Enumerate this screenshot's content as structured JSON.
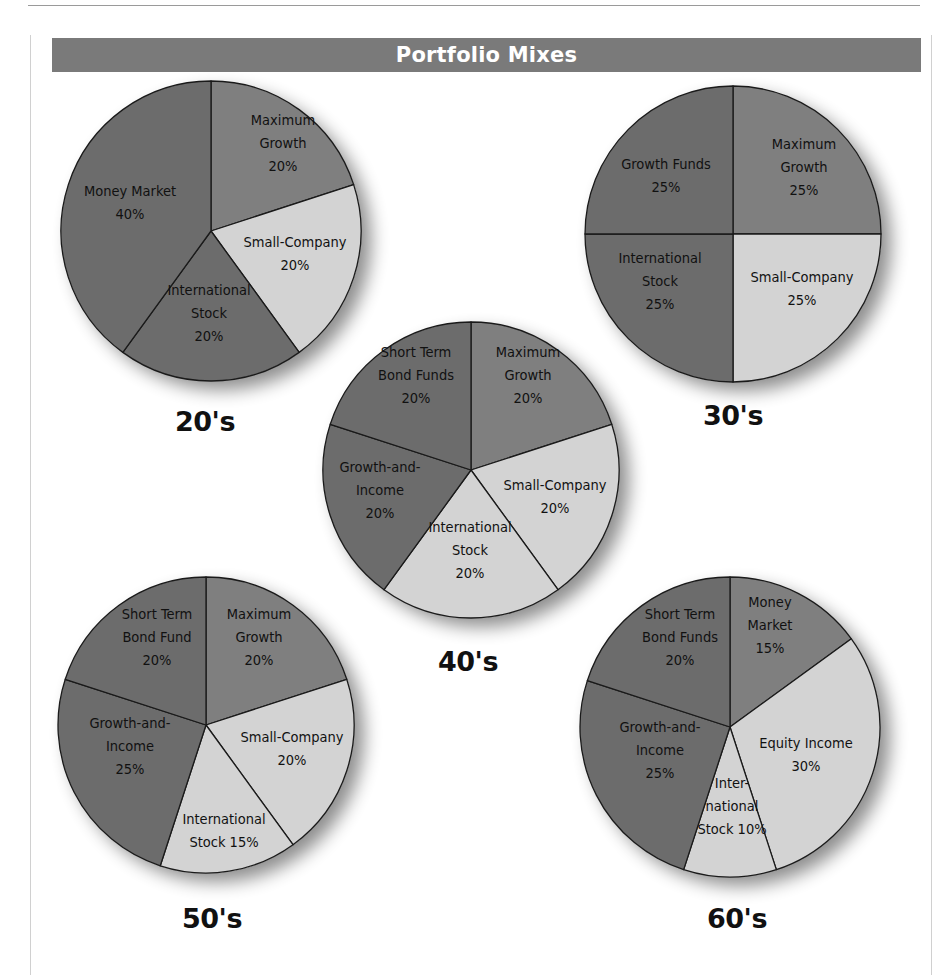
{
  "header": {
    "title": "Portfolio Mixes"
  },
  "colors": {
    "dark": "#6c6c6c",
    "medium": "#7f7f7f",
    "light": "#d3d3d3",
    "header_bg": "#7a7a7a",
    "outline": "#1a1a1a"
  },
  "chart_data": [
    {
      "type": "pie",
      "title": "20's",
      "center": [
        211,
        231
      ],
      "radius": 150,
      "label_pos": [
        205,
        428
      ],
      "slices": [
        {
          "label": [
            "Maximum",
            "Growth",
            "20%"
          ],
          "name": "Maximum Growth",
          "value": 20,
          "shade": "medium",
          "lx": 283,
          "ly": 143
        },
        {
          "label": [
            "Small-Company",
            "20%"
          ],
          "name": "Small-Company",
          "value": 20,
          "shade": "light",
          "lx": 295,
          "ly": 253
        },
        {
          "label": [
            "International",
            "Stock",
            "20%"
          ],
          "name": "International Stock",
          "value": 20,
          "shade": "dark",
          "lx": 209,
          "ly": 313
        },
        {
          "label": [
            "Money Market",
            "40%"
          ],
          "name": "Money Market",
          "value": 40,
          "shade": "dark",
          "lx": 130,
          "ly": 202
        }
      ]
    },
    {
      "type": "pie",
      "title": "30's",
      "center": [
        733,
        234
      ],
      "radius": 148,
      "label_pos": [
        733,
        422
      ],
      "slices": [
        {
          "label": [
            "Maximum",
            "Growth",
            "25%"
          ],
          "name": "Maximum Growth",
          "value": 25,
          "shade": "medium",
          "lx": 804,
          "ly": 167
        },
        {
          "label": [
            "Small-Company",
            "25%"
          ],
          "name": "Small-Company",
          "value": 25,
          "shade": "light",
          "lx": 802,
          "ly": 288
        },
        {
          "label": [
            "International",
            "Stock",
            "25%"
          ],
          "name": "International Stock",
          "value": 25,
          "shade": "dark",
          "lx": 660,
          "ly": 281
        },
        {
          "label": [
            "Growth Funds",
            "25%"
          ],
          "name": "Growth Funds",
          "value": 25,
          "shade": "dark",
          "lx": 666,
          "ly": 175
        }
      ]
    },
    {
      "type": "pie",
      "title": "40's",
      "center": [
        471,
        470
      ],
      "radius": 148,
      "label_pos": [
        468,
        668
      ],
      "slices": [
        {
          "label": [
            "Maximum",
            "Growth",
            "20%"
          ],
          "name": "Maximum Growth",
          "value": 20,
          "shade": "medium",
          "lx": 528,
          "ly": 375
        },
        {
          "label": [
            "Small-Company",
            "20%"
          ],
          "name": "Small-Company",
          "value": 20,
          "shade": "light",
          "lx": 555,
          "ly": 496
        },
        {
          "label": [
            "International",
            "Stock",
            "20%"
          ],
          "name": "International Stock",
          "value": 20,
          "shade": "light",
          "lx": 470,
          "ly": 550
        },
        {
          "label": [
            "Growth-and-",
            "Income",
            "20%"
          ],
          "name": "Growth-and-Income",
          "value": 20,
          "shade": "dark",
          "lx": 380,
          "ly": 490
        },
        {
          "label": [
            "Short Term",
            "Bond Funds",
            "20%"
          ],
          "name": "Short Term Bond Funds",
          "value": 20,
          "shade": "dark",
          "lx": 416,
          "ly": 375
        }
      ]
    },
    {
      "type": "pie",
      "title": "50's",
      "center": [
        206,
        725
      ],
      "radius": 148,
      "label_pos": [
        212,
        925
      ],
      "slices": [
        {
          "label": [
            "Maximum",
            "Growth",
            "20%"
          ],
          "name": "Maximum Growth",
          "value": 20,
          "shade": "medium",
          "lx": 259,
          "ly": 637
        },
        {
          "label": [
            "Small-Company",
            "20%"
          ],
          "name": "Small-Company",
          "value": 20,
          "shade": "light",
          "lx": 292,
          "ly": 748
        },
        {
          "label": [
            "International",
            "Stock 15%"
          ],
          "name": "International Stock",
          "value": 15,
          "shade": "light",
          "lx": 224,
          "ly": 830
        },
        {
          "label": [
            "Growth-and-",
            "Income",
            "25%"
          ],
          "name": "Growth-and-Income",
          "value": 25,
          "shade": "dark",
          "lx": 130,
          "ly": 746
        },
        {
          "label": [
            "Short Term",
            "Bond Fund",
            "20%"
          ],
          "name": "Short Term Bond Fund",
          "value": 20,
          "shade": "dark",
          "lx": 157,
          "ly": 637
        }
      ]
    },
    {
      "type": "pie",
      "title": "60's",
      "center": [
        730,
        727
      ],
      "radius": 150,
      "label_pos": [
        737,
        925
      ],
      "slices": [
        {
          "label": [
            "Money",
            "Market",
            "15%"
          ],
          "name": "Money Market",
          "value": 15,
          "shade": "medium",
          "lx": 770,
          "ly": 625
        },
        {
          "label": [
            "Equity Income",
            "30%"
          ],
          "name": "Equity Income",
          "value": 30,
          "shade": "light",
          "lx": 806,
          "ly": 754
        },
        {
          "label": [
            "Inter-",
            "national",
            "Stock 10%"
          ],
          "name": "International Stock",
          "value": 10,
          "shade": "light",
          "lx": 732,
          "ly": 806
        },
        {
          "label": [
            "Growth-and-",
            "Income",
            "25%"
          ],
          "name": "Growth-and-Income",
          "value": 25,
          "shade": "dark",
          "lx": 660,
          "ly": 750
        },
        {
          "label": [
            "Short Term",
            "Bond Funds",
            "20%"
          ],
          "name": "Short Term Bond Funds",
          "value": 20,
          "shade": "dark",
          "lx": 680,
          "ly": 637
        }
      ]
    }
  ]
}
